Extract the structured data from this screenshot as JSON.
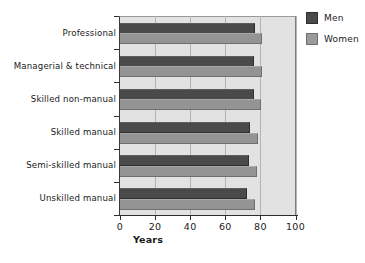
{
  "chart_data": {
    "type": "bar",
    "orientation": "horizontal",
    "title": "",
    "xlabel": "Years",
    "ylabel": "",
    "xlim": [
      0,
      100
    ],
    "xticks": [
      0,
      20,
      40,
      60,
      80,
      100
    ],
    "grid": true,
    "legend_position": "top-right",
    "categories": [
      "Professional",
      "Managerial & technical",
      "Skilled non-manual",
      "Skilled manual",
      "Semi-skilled manual",
      "Unskilled manual"
    ],
    "series": [
      {
        "name": "Men",
        "color": "#4a4a4a",
        "values": [
          76.5,
          76.0,
          76.0,
          73.5,
          73.0,
          72.0
        ]
      },
      {
        "name": "Women",
        "color": "#949494",
        "values": [
          80.5,
          80.5,
          80.0,
          78.0,
          77.5,
          76.5
        ]
      }
    ]
  },
  "legend": {
    "items": [
      {
        "label": "Men"
      },
      {
        "label": "Women"
      }
    ]
  },
  "axis": {
    "x_title": "Years",
    "tick_labels": [
      "0",
      "20",
      "40",
      "60",
      "80",
      "100"
    ]
  }
}
